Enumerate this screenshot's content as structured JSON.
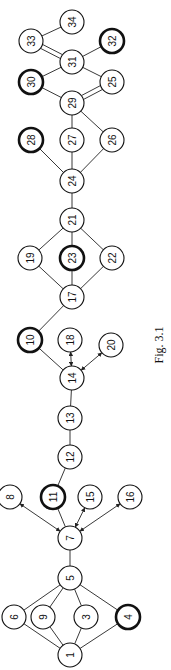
{
  "figure": {
    "caption": "Fig. 3.1",
    "orientation": "rotated-90-ccw",
    "node_radius": 12,
    "nodes": [
      {
        "id": "1",
        "label": "1",
        "x": 70,
        "y": 655,
        "bold": false
      },
      {
        "id": "6",
        "label": "6",
        "x": 14,
        "y": 617,
        "bold": false
      },
      {
        "id": "9",
        "label": "9",
        "x": 43,
        "y": 617,
        "bold": false
      },
      {
        "id": "3",
        "label": "3",
        "x": 86,
        "y": 617,
        "bold": false
      },
      {
        "id": "4",
        "label": "4",
        "x": 128,
        "y": 617,
        "bold": true
      },
      {
        "id": "5",
        "label": "5",
        "x": 70,
        "y": 578,
        "bold": false
      },
      {
        "id": "7",
        "label": "7",
        "x": 70,
        "y": 538,
        "bold": false
      },
      {
        "id": "8",
        "label": "8",
        "x": 10,
        "y": 497,
        "bold": false
      },
      {
        "id": "11",
        "label": "11",
        "x": 53,
        "y": 497,
        "bold": true
      },
      {
        "id": "15",
        "label": "15",
        "x": 90,
        "y": 497,
        "bold": false
      },
      {
        "id": "16",
        "label": "16",
        "x": 130,
        "y": 497,
        "bold": false
      },
      {
        "id": "12",
        "label": "12",
        "x": 70,
        "y": 457,
        "bold": false
      },
      {
        "id": "13",
        "label": "13",
        "x": 70,
        "y": 418,
        "bold": false
      },
      {
        "id": "14",
        "label": "14",
        "x": 72,
        "y": 378,
        "bold": false
      },
      {
        "id": "10",
        "label": "10",
        "x": 30,
        "y": 340,
        "bold": true
      },
      {
        "id": "18",
        "label": "18",
        "x": 70,
        "y": 340,
        "bold": false
      },
      {
        "id": "20",
        "label": "20",
        "x": 111,
        "y": 345,
        "bold": false
      },
      {
        "id": "17",
        "label": "17",
        "x": 72,
        "y": 297,
        "bold": false
      },
      {
        "id": "19",
        "label": "19",
        "x": 30,
        "y": 258,
        "bold": false
      },
      {
        "id": "23",
        "label": "23",
        "x": 72,
        "y": 258,
        "bold": true
      },
      {
        "id": "22",
        "label": "22",
        "x": 112,
        "y": 258,
        "bold": false
      },
      {
        "id": "21",
        "label": "21",
        "x": 72,
        "y": 220,
        "bold": false
      },
      {
        "id": "24",
        "label": "24",
        "x": 72,
        "y": 181,
        "bold": false
      },
      {
        "id": "28",
        "label": "28",
        "x": 31,
        "y": 140,
        "bold": true
      },
      {
        "id": "27",
        "label": "27",
        "x": 72,
        "y": 140,
        "bold": false
      },
      {
        "id": "26",
        "label": "26",
        "x": 112,
        "y": 140,
        "bold": false
      },
      {
        "id": "29",
        "label": "29",
        "x": 72,
        "y": 103,
        "bold": false
      },
      {
        "id": "30",
        "label": "30",
        "x": 31,
        "y": 82,
        "bold": true
      },
      {
        "id": "25",
        "label": "25",
        "x": 112,
        "y": 82,
        "bold": false
      },
      {
        "id": "31",
        "label": "31",
        "x": 72,
        "y": 62,
        "bold": false
      },
      {
        "id": "33",
        "label": "33",
        "x": 31,
        "y": 41,
        "bold": false
      },
      {
        "id": "32",
        "label": "32",
        "x": 112,
        "y": 41,
        "bold": true
      },
      {
        "id": "34",
        "label": "34",
        "x": 72,
        "y": 22,
        "bold": false
      }
    ],
    "edges": [
      {
        "from": "1",
        "to": "6",
        "type": "line"
      },
      {
        "from": "1",
        "to": "9",
        "type": "line"
      },
      {
        "from": "1",
        "to": "3",
        "type": "line"
      },
      {
        "from": "1",
        "to": "4",
        "type": "line"
      },
      {
        "from": "5",
        "to": "6",
        "type": "line"
      },
      {
        "from": "5",
        "to": "9",
        "type": "line"
      },
      {
        "from": "5",
        "to": "3",
        "type": "line"
      },
      {
        "from": "5",
        "to": "4",
        "type": "line"
      },
      {
        "from": "5",
        "to": "7",
        "type": "line"
      },
      {
        "from": "7",
        "to": "8",
        "type": "double-arrow"
      },
      {
        "from": "7",
        "to": "11",
        "type": "line"
      },
      {
        "from": "7",
        "to": "15",
        "type": "double-arrow"
      },
      {
        "from": "7",
        "to": "16",
        "type": "double-arrow"
      },
      {
        "from": "11",
        "to": "12",
        "type": "line"
      },
      {
        "from": "12",
        "to": "13",
        "type": "line"
      },
      {
        "from": "13",
        "to": "14",
        "type": "line"
      },
      {
        "from": "14",
        "to": "10",
        "type": "line"
      },
      {
        "from": "14",
        "to": "18",
        "type": "double-arrow"
      },
      {
        "from": "14",
        "to": "20",
        "type": "double-arrow"
      },
      {
        "from": "10",
        "to": "17",
        "type": "line"
      },
      {
        "from": "17",
        "to": "19",
        "type": "line"
      },
      {
        "from": "17",
        "to": "23",
        "type": "line"
      },
      {
        "from": "17",
        "to": "22",
        "type": "line"
      },
      {
        "from": "19",
        "to": "21",
        "type": "line"
      },
      {
        "from": "23",
        "to": "21",
        "type": "line"
      },
      {
        "from": "22",
        "to": "21",
        "type": "line"
      },
      {
        "from": "21",
        "to": "24",
        "type": "line"
      },
      {
        "from": "24",
        "to": "28",
        "type": "line"
      },
      {
        "from": "24",
        "to": "27",
        "type": "line"
      },
      {
        "from": "24",
        "to": "26",
        "type": "line"
      },
      {
        "from": "27",
        "to": "29",
        "type": "line"
      },
      {
        "from": "26",
        "to": "29",
        "type": "line"
      },
      {
        "from": "29",
        "to": "30",
        "type": "line"
      },
      {
        "from": "29",
        "to": "25",
        "type": "double-line"
      },
      {
        "from": "30",
        "to": "31",
        "type": "line"
      },
      {
        "from": "25",
        "to": "31",
        "type": "line"
      },
      {
        "from": "31",
        "to": "33",
        "type": "double-line"
      },
      {
        "from": "31",
        "to": "32",
        "type": "line"
      },
      {
        "from": "33",
        "to": "34",
        "type": "line"
      }
    ]
  }
}
